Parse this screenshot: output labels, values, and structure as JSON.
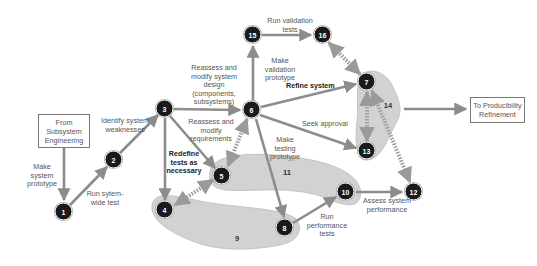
{
  "diagram": {
    "boxes": {
      "from_subsystem": "From Subsystem Engineering",
      "to_producibility": "To Producibility Refinement"
    },
    "nodes": [
      "1",
      "2",
      "3",
      "4",
      "5",
      "6",
      "7",
      "8",
      "10",
      "12",
      "13",
      "15",
      "16"
    ],
    "regions": {
      "r9": "9",
      "r11": "11",
      "r14": "14"
    },
    "labels": {
      "make_system_prototype": "Make system prototype",
      "run_system_wide_test": "Run sytem-wide test",
      "identify_weaknesses": "Identify system weaknesses",
      "reassess_design": "Reassess and modify system design (components, subsystems)",
      "reassess_requirements": "Reassess and modify requirements",
      "redefine_tests": "Redefine tests as necessary",
      "make_validation_prototype": "Make validation prototype",
      "run_validation_tests": "Run validation tests",
      "refine_system": "Refine system",
      "seek_approval": "Seek approval",
      "make_testing_prototype": "Make testing prototype",
      "run_performance_tests": "Run performance tests",
      "assess_performance": "Assess system performance"
    },
    "colors": {
      "arrow": "#8c8c8c",
      "region": "#d4d4d4",
      "node": "#1a1a1a",
      "dashed": "#a0a0a0"
    }
  }
}
